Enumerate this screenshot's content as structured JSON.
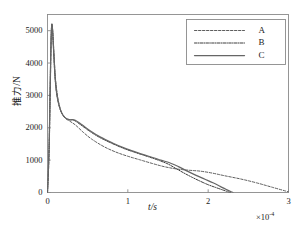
{
  "chart_data": {
    "type": "line",
    "title": "",
    "xlabel": "t/s",
    "ylabel": "推力/N",
    "x_multiplier": "×10",
    "x_multiplier_exponent": "-4",
    "xlim": [
      0,
      3
    ],
    "ylim": [
      0,
      5500
    ],
    "xticks": [
      0,
      1,
      2,
      3
    ],
    "xtick_labels": [
      "0",
      "1",
      "2",
      "3"
    ],
    "yticks": [
      0,
      1000,
      2000,
      3000,
      4000,
      5000
    ],
    "ytick_labels": [
      "0",
      "1000",
      "2000",
      "3000",
      "4000",
      "5000"
    ],
    "grid": false,
    "legend_position": "upper right",
    "series": [
      {
        "name": "A",
        "style": "dashed",
        "color": "#555555",
        "points": [
          [
            0.0,
            0
          ],
          [
            0.02,
            1200
          ],
          [
            0.035,
            3200
          ],
          [
            0.045,
            4600
          ],
          [
            0.055,
            5150
          ],
          [
            0.065,
            5000
          ],
          [
            0.08,
            4300
          ],
          [
            0.1,
            3500
          ],
          [
            0.13,
            2900
          ],
          [
            0.17,
            2500
          ],
          [
            0.22,
            2300
          ],
          [
            0.28,
            2200
          ],
          [
            0.35,
            2080
          ],
          [
            0.45,
            1850
          ],
          [
            0.55,
            1650
          ],
          [
            0.7,
            1420
          ],
          [
            0.85,
            1250
          ],
          [
            1.0,
            1120
          ],
          [
            1.15,
            1010
          ],
          [
            1.3,
            900
          ],
          [
            1.45,
            800
          ],
          [
            1.6,
            730
          ],
          [
            1.75,
            690
          ],
          [
            1.9,
            660
          ],
          [
            2.05,
            600
          ],
          [
            2.2,
            520
          ],
          [
            2.4,
            420
          ],
          [
            2.6,
            300
          ],
          [
            2.8,
            160
          ],
          [
            3.0,
            20
          ]
        ]
      },
      {
        "name": "B",
        "style": "dashdot",
        "color": "#333333",
        "points": [
          [
            0.0,
            0
          ],
          [
            0.02,
            1500
          ],
          [
            0.035,
            3600
          ],
          [
            0.045,
            4800
          ],
          [
            0.053,
            5200
          ],
          [
            0.062,
            5050
          ],
          [
            0.075,
            4400
          ],
          [
            0.095,
            3500
          ],
          [
            0.12,
            2950
          ],
          [
            0.16,
            2550
          ],
          [
            0.21,
            2330
          ],
          [
            0.27,
            2250
          ],
          [
            0.33,
            2230
          ],
          [
            0.42,
            2080
          ],
          [
            0.52,
            1900
          ],
          [
            0.65,
            1700
          ],
          [
            0.8,
            1520
          ],
          [
            0.95,
            1360
          ],
          [
            1.1,
            1230
          ],
          [
            1.25,
            1110
          ],
          [
            1.4,
            980
          ],
          [
            1.5,
            880
          ],
          [
            1.6,
            740
          ],
          [
            1.7,
            600
          ],
          [
            1.8,
            470
          ],
          [
            1.9,
            350
          ],
          [
            2.0,
            240
          ],
          [
            2.1,
            150
          ],
          [
            2.18,
            80
          ],
          [
            2.25,
            20
          ],
          [
            2.28,
            0
          ]
        ]
      },
      {
        "name": "C",
        "style": "solid",
        "color": "#666666",
        "points": [
          [
            0.0,
            0
          ],
          [
            0.02,
            1400
          ],
          [
            0.035,
            3500
          ],
          [
            0.045,
            4750
          ],
          [
            0.054,
            5180
          ],
          [
            0.063,
            5020
          ],
          [
            0.078,
            4350
          ],
          [
            0.098,
            3480
          ],
          [
            0.125,
            2920
          ],
          [
            0.165,
            2530
          ],
          [
            0.215,
            2320
          ],
          [
            0.275,
            2250
          ],
          [
            0.34,
            2240
          ],
          [
            0.43,
            2090
          ],
          [
            0.53,
            1910
          ],
          [
            0.66,
            1710
          ],
          [
            0.81,
            1530
          ],
          [
            0.96,
            1370
          ],
          [
            1.11,
            1240
          ],
          [
            1.26,
            1120
          ],
          [
            1.41,
            1000
          ],
          [
            1.52,
            920
          ],
          [
            1.63,
            800
          ],
          [
            1.74,
            660
          ],
          [
            1.85,
            530
          ],
          [
            1.96,
            410
          ],
          [
            2.06,
            300
          ],
          [
            2.15,
            190
          ],
          [
            2.22,
            100
          ],
          [
            2.28,
            30
          ],
          [
            2.31,
            0
          ]
        ]
      }
    ],
    "legend_entries": [
      {
        "label": "A",
        "style": "dashed"
      },
      {
        "label": "B",
        "style": "dashdot"
      },
      {
        "label": "C",
        "style": "solid"
      }
    ]
  }
}
